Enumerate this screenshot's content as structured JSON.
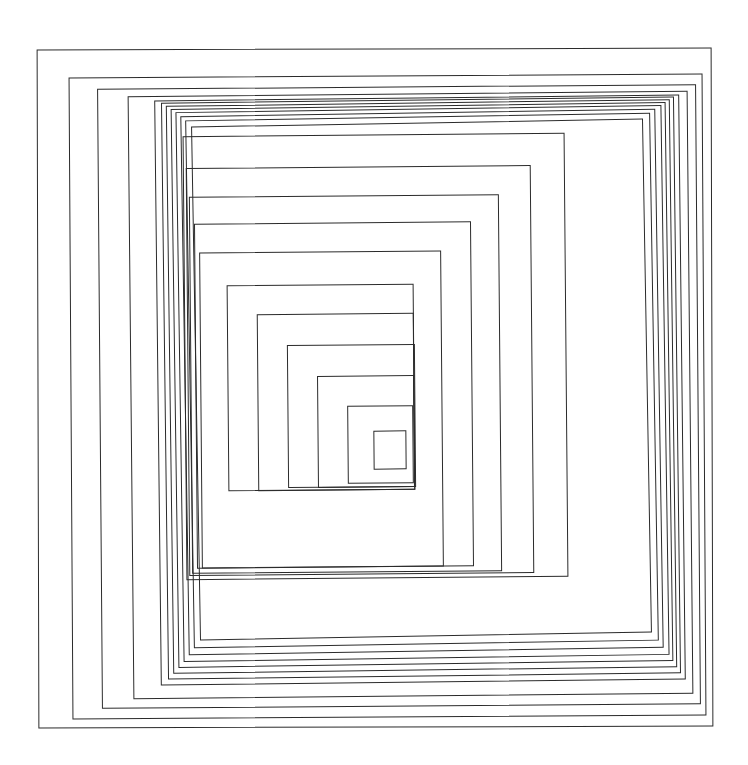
{
  "figure": {
    "title": "Nested concentric rectangles",
    "kind": "line-drawing",
    "canvas": {
      "width": 748,
      "height": 765
    },
    "background_color": "#ffffff",
    "stroke_color": "#2b2b2b",
    "stroke_width": 1,
    "rectangle_count": 22,
    "convergence_point": {
      "x": 395,
      "y": 455
    }
  },
  "chart_data": {
    "type": "line",
    "title": "Nested concentric rectangles",
    "xlabel": "",
    "ylabel": "",
    "xlim": [
      0,
      748
    ],
    "ylim": [
      0,
      765
    ],
    "grid": false,
    "legend": "none",
    "rectangles": [
      {
        "index": 1,
        "x": 38,
        "y": 49,
        "width": 674,
        "height": 678,
        "rotation": -0.15
      },
      {
        "index": 2,
        "x": 71,
        "y": 76,
        "width": 633,
        "height": 641,
        "rotation": -0.35
      },
      {
        "index": 3,
        "x": 100,
        "y": 87,
        "width": 598,
        "height": 619,
        "rotation": -0.45
      },
      {
        "index": 4,
        "x": 131,
        "y": 94,
        "width": 559,
        "height": 602,
        "rotation": -0.55
      },
      {
        "index": 5,
        "x": 158,
        "y": 98,
        "width": 524,
        "height": 584,
        "rotation": -0.65
      },
      {
        "index": 6,
        "x": 165,
        "y": 100,
        "width": 512,
        "height": 576,
        "rotation": -0.7
      },
      {
        "index": 7,
        "x": 170,
        "y": 103,
        "width": 503,
        "height": 567,
        "rotation": -0.75
      },
      {
        "index": 8,
        "x": 175,
        "y": 106,
        "width": 494,
        "height": 558,
        "rotation": -0.8
      },
      {
        "index": 9,
        "x": 180,
        "y": 109,
        "width": 485,
        "height": 549,
        "rotation": -0.85
      },
      {
        "index": 10,
        "x": 185,
        "y": 113,
        "width": 474,
        "height": 538,
        "rotation": -0.9
      },
      {
        "index": 11,
        "x": 190,
        "y": 117,
        "width": 464,
        "height": 527,
        "rotation": -0.95
      },
      {
        "index": 12,
        "x": 196,
        "y": 123,
        "width": 451,
        "height": 513,
        "rotation": -1.0
      },
      {
        "index": 13,
        "x": 185,
        "y": 135,
        "width": 381,
        "height": 443,
        "rotation": -0.5
      },
      {
        "index": 14,
        "x": 188,
        "y": 167,
        "width": 344,
        "height": 407,
        "rotation": -0.5
      },
      {
        "index": 15,
        "x": 191,
        "y": 196,
        "width": 309,
        "height": 376,
        "rotation": -0.5
      },
      {
        "index": 16,
        "x": 196,
        "y": 223,
        "width": 276,
        "height": 344,
        "rotation": -0.5
      },
      {
        "index": 17,
        "x": 201,
        "y": 252,
        "width": 241,
        "height": 315,
        "rotation": -0.5
      },
      {
        "index": 18,
        "x": 228,
        "y": 285,
        "width": 186,
        "height": 205,
        "rotation": -0.5
      },
      {
        "index": 19,
        "x": 258,
        "y": 314,
        "width": 156,
        "height": 176,
        "rotation": -0.5
      },
      {
        "index": 20,
        "x": 288,
        "y": 345,
        "width": 127,
        "height": 142,
        "rotation": -0.5
      },
      {
        "index": 21,
        "x": 318,
        "y": 376,
        "width": 96,
        "height": 111,
        "rotation": -0.5
      },
      {
        "index": 22,
        "x": 348,
        "y": 406,
        "width": 65,
        "height": 77,
        "rotation": -0.5
      },
      {
        "index": 23,
        "x": 374,
        "y": 431,
        "width": 32,
        "height": 38,
        "rotation": -0.5
      }
    ]
  }
}
